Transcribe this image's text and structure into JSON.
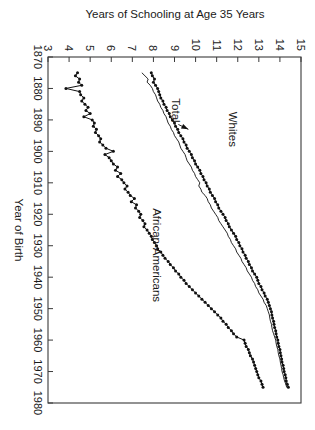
{
  "chart_data": {
    "type": "line",
    "title": "",
    "xlabel": "Year of Birth",
    "ylabel": "Years of Schooling at Age 35 Years",
    "xlim": [
      1870,
      1980
    ],
    "ylim": [
      3,
      15
    ],
    "xticks": [
      1870,
      1880,
      1890,
      1900,
      1910,
      1920,
      1930,
      1940,
      1950,
      1960,
      1970,
      1980
    ],
    "yticks": [
      3,
      4,
      5,
      6,
      7,
      8,
      9,
      10,
      11,
      12,
      13,
      14,
      15
    ],
    "grid": false,
    "legend_position": "inline-annotations",
    "annotations": [
      {
        "text": "Whites",
        "x": 1893,
        "y": 11.6
      },
      {
        "text": "African-Americans",
        "x": 1933,
        "y": 8.0
      },
      {
        "text": "Total",
        "x": 1887,
        "y": 8.9,
        "arrow_to_x": 1893,
        "arrow_to_y": 9.8
      }
    ],
    "series": [
      {
        "name": "Whites",
        "marker": "filled-circle",
        "x": [
          1875,
          1876,
          1877,
          1878,
          1879,
          1880,
          1881,
          1882,
          1883,
          1884,
          1885,
          1886,
          1887,
          1888,
          1889,
          1890,
          1891,
          1892,
          1893,
          1894,
          1895,
          1896,
          1897,
          1898,
          1899,
          1900,
          1901,
          1902,
          1903,
          1904,
          1905,
          1906,
          1907,
          1908,
          1909,
          1910,
          1911,
          1912,
          1913,
          1914,
          1915,
          1916,
          1917,
          1918,
          1919,
          1920,
          1921,
          1922,
          1923,
          1924,
          1925,
          1926,
          1927,
          1928,
          1929,
          1930,
          1931,
          1932,
          1933,
          1934,
          1935,
          1936,
          1937,
          1938,
          1939,
          1940,
          1941,
          1942,
          1943,
          1944,
          1945,
          1946,
          1947,
          1948,
          1949,
          1950,
          1951,
          1952,
          1953,
          1954,
          1955,
          1956,
          1957,
          1958,
          1959,
          1960,
          1961,
          1962,
          1963,
          1964,
          1965,
          1966,
          1967,
          1968,
          1969,
          1970,
          1971,
          1972,
          1973,
          1974,
          1975
        ],
        "y": [
          7.9,
          7.95,
          8.05,
          8.0,
          8.1,
          8.2,
          8.25,
          8.3,
          8.35,
          8.45,
          8.5,
          8.6,
          8.65,
          8.75,
          8.8,
          8.9,
          9.0,
          9.05,
          9.15,
          9.2,
          9.3,
          9.4,
          9.45,
          9.55,
          9.6,
          9.7,
          9.8,
          9.85,
          9.95,
          10.0,
          10.1,
          10.2,
          10.25,
          10.35,
          10.4,
          10.5,
          10.55,
          10.65,
          10.7,
          10.8,
          10.9,
          10.95,
          11.05,
          11.1,
          11.2,
          11.3,
          11.4,
          11.45,
          11.55,
          11.6,
          11.7,
          11.8,
          11.9,
          11.95,
          12.05,
          12.1,
          12.2,
          12.25,
          12.35,
          12.4,
          12.5,
          12.55,
          12.65,
          12.7,
          12.8,
          12.9,
          12.95,
          13.0,
          13.1,
          13.15,
          13.25,
          13.3,
          13.4,
          13.45,
          13.5,
          13.55,
          13.6,
          13.62,
          13.65,
          13.7,
          13.72,
          13.75,
          13.8,
          13.82,
          13.85,
          13.9,
          13.92,
          13.95,
          14.0,
          14.02,
          14.05,
          14.08,
          14.1,
          14.15,
          14.18,
          14.2,
          14.25,
          14.28,
          14.3,
          14.35,
          14.4
        ]
      },
      {
        "name": "Total",
        "marker": "none",
        "x": [
          1875,
          1876,
          1877,
          1878,
          1879,
          1880,
          1881,
          1882,
          1883,
          1884,
          1885,
          1886,
          1887,
          1888,
          1889,
          1890,
          1891,
          1892,
          1893,
          1894,
          1895,
          1896,
          1897,
          1898,
          1899,
          1900,
          1901,
          1902,
          1903,
          1904,
          1905,
          1906,
          1907,
          1908,
          1909,
          1910,
          1911,
          1912,
          1913,
          1914,
          1915,
          1916,
          1917,
          1918,
          1919,
          1920,
          1921,
          1922,
          1923,
          1924,
          1925,
          1926,
          1927,
          1928,
          1929,
          1930,
          1931,
          1932,
          1933,
          1934,
          1935,
          1936,
          1937,
          1938,
          1939,
          1940,
          1941,
          1942,
          1943,
          1944,
          1945,
          1946,
          1947,
          1948,
          1949,
          1950,
          1951,
          1952,
          1953,
          1954,
          1955,
          1956,
          1957,
          1958,
          1959,
          1960,
          1961,
          1962,
          1963,
          1964,
          1965,
          1966,
          1967,
          1968,
          1969,
          1970,
          1971,
          1972,
          1973,
          1974,
          1975
        ],
        "y": [
          7.45,
          7.6,
          7.75,
          7.7,
          7.85,
          7.95,
          8.0,
          8.1,
          8.15,
          8.2,
          8.3,
          8.35,
          8.45,
          8.5,
          8.6,
          8.65,
          8.7,
          8.8,
          8.85,
          8.95,
          9.0,
          9.1,
          9.2,
          9.25,
          9.3,
          9.4,
          9.5,
          9.55,
          9.6,
          9.7,
          9.8,
          9.85,
          9.95,
          10.0,
          10.1,
          10.2,
          10.15,
          10.25,
          10.3,
          10.45,
          10.55,
          10.6,
          10.7,
          10.75,
          10.85,
          10.95,
          11.05,
          11.1,
          11.2,
          11.3,
          11.4,
          11.5,
          11.55,
          11.65,
          11.7,
          11.8,
          11.9,
          11.95,
          12.05,
          12.15,
          12.2,
          12.3,
          12.4,
          12.45,
          12.55,
          12.65,
          12.7,
          12.8,
          12.85,
          12.95,
          13.0,
          13.1,
          13.2,
          13.25,
          13.35,
          13.4,
          13.45,
          13.5,
          13.52,
          13.55,
          13.6,
          13.62,
          13.65,
          13.7,
          13.75,
          13.8,
          13.82,
          13.85,
          13.9,
          13.92,
          13.95,
          14.0,
          14.02,
          14.05,
          14.08,
          14.1,
          14.15,
          14.18,
          14.22,
          14.28,
          14.32
        ]
      },
      {
        "name": "African-Americans",
        "marker": "filled-circle",
        "x": [
          1875,
          1876,
          1877,
          1878,
          1879,
          1880,
          1881,
          1882,
          1883,
          1884,
          1885,
          1886,
          1887,
          1888,
          1889,
          1890,
          1891,
          1892,
          1893,
          1894,
          1895,
          1896,
          1897,
          1898,
          1899,
          1900,
          1901,
          1902,
          1903,
          1904,
          1905,
          1906,
          1907,
          1908,
          1909,
          1910,
          1911,
          1912,
          1913,
          1914,
          1915,
          1916,
          1917,
          1918,
          1919,
          1920,
          1921,
          1922,
          1923,
          1924,
          1925,
          1926,
          1927,
          1928,
          1929,
          1930,
          1931,
          1932,
          1933,
          1934,
          1935,
          1936,
          1937,
          1938,
          1939,
          1940,
          1941,
          1942,
          1943,
          1944,
          1945,
          1946,
          1947,
          1948,
          1949,
          1950,
          1951,
          1952,
          1953,
          1954,
          1955,
          1956,
          1957,
          1958,
          1959,
          1960,
          1961,
          1962,
          1963,
          1964,
          1965,
          1966,
          1967,
          1968,
          1969,
          1970,
          1971,
          1972,
          1973,
          1974,
          1975
        ],
        "y": [
          4.4,
          4.3,
          4.5,
          4.45,
          4.6,
          3.85,
          4.5,
          4.55,
          4.7,
          4.6,
          4.75,
          4.9,
          4.8,
          5.0,
          4.7,
          5.1,
          5.2,
          5.15,
          5.3,
          5.25,
          5.4,
          5.5,
          5.45,
          5.6,
          5.75,
          6.1,
          5.7,
          5.9,
          6.0,
          6.1,
          6.3,
          6.2,
          6.45,
          6.3,
          6.5,
          6.6,
          6.75,
          6.65,
          6.8,
          6.9,
          7.1,
          6.95,
          7.2,
          7.15,
          7.3,
          7.4,
          7.35,
          7.5,
          7.6,
          7.55,
          7.7,
          7.8,
          7.9,
          7.95,
          8.05,
          8.15,
          8.2,
          8.35,
          8.45,
          8.55,
          8.7,
          8.8,
          8.95,
          9.05,
          9.2,
          9.3,
          9.45,
          9.55,
          9.7,
          9.85,
          10.0,
          10.15,
          10.3,
          10.45,
          10.6,
          10.75,
          10.9,
          11.05,
          11.2,
          11.3,
          11.45,
          11.55,
          11.7,
          11.8,
          11.95,
          12.3,
          12.35,
          12.4,
          12.5,
          12.55,
          12.6,
          12.7,
          12.75,
          12.8,
          12.85,
          12.9,
          12.95,
          13.0,
          13.1,
          13.15,
          13.2
        ]
      }
    ]
  },
  "axes": {
    "x_title": "Year of Birth",
    "y_title": "Years of Schooling at Age 35 Years"
  },
  "labels": {
    "whites": "Whites",
    "african_americans": "African-Americans",
    "total": "Total"
  },
  "colors": {
    "line": "#111111",
    "frame": "#3a3a3a",
    "background": "#ffffff"
  }
}
